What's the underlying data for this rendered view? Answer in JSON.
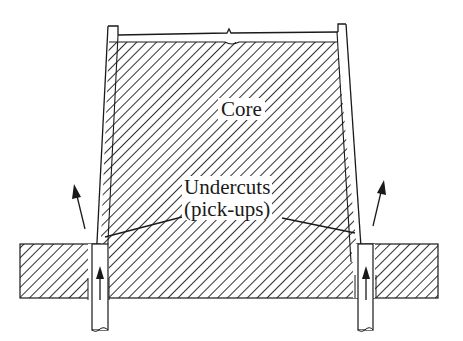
{
  "figure": {
    "type": "cross-section diagram",
    "labels": {
      "core": "Core",
      "undercuts_line1": "Undercuts",
      "undercuts_line2": "(pick-ups)"
    },
    "arrows": [
      {
        "name": "left-motion-arrow",
        "direction": "up-left"
      },
      {
        "name": "right-motion-arrow",
        "direction": "up-right"
      },
      {
        "name": "left-pin-arrow",
        "direction": "up"
      },
      {
        "name": "right-pin-arrow",
        "direction": "up"
      }
    ],
    "colors": {
      "line": "#1a1a1a",
      "hatch": "#3a3a3a",
      "background": "#ffffff"
    }
  }
}
